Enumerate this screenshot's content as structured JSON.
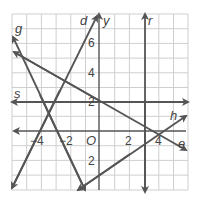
{
  "graph": {
    "grid": {
      "x_min": -6,
      "x_max": 6,
      "y_min": -4,
      "y_max": 8,
      "step": 1
    },
    "colors": {
      "grid": "#cfcfcf",
      "line": "#555555",
      "text": "#444444"
    },
    "axes": {
      "x_label": "",
      "y_label": "y",
      "origin_label": "O"
    },
    "tick_labels": {
      "x": [
        {
          "value": -4,
          "text": "−4"
        },
        {
          "value": -2,
          "text": "−2"
        },
        {
          "value": 2,
          "text": "2"
        },
        {
          "value": 4,
          "text": "4"
        }
      ],
      "y": [
        {
          "value": 6,
          "text": "6"
        },
        {
          "value": 4,
          "text": "4"
        },
        {
          "value": 2,
          "text": "2"
        },
        {
          "value": -2,
          "text": "2"
        }
      ]
    },
    "lines": [
      {
        "name": "g",
        "label": "g",
        "from": [
          -6,
          6.6
        ],
        "to": [
          -1,
          -4
        ]
      },
      {
        "name": "d",
        "label": "d",
        "from": [
          -6,
          -3.9
        ],
        "to": [
          0,
          8
        ]
      },
      {
        "name": "e",
        "label": "e",
        "from": [
          -6,
          5.4
        ],
        "to": [
          6,
          -1.3
        ]
      },
      {
        "name": "h",
        "label": "h",
        "from": [
          -1.4,
          -4
        ],
        "to": [
          6,
          1
        ]
      },
      {
        "name": "s",
        "label": "s",
        "from": [
          -6,
          2
        ],
        "to": [
          6,
          2
        ]
      },
      {
        "name": "r",
        "label": "r",
        "from": [
          3,
          -4
        ],
        "to": [
          3,
          8
        ]
      }
    ]
  }
}
